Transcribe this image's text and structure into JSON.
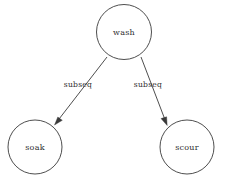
{
  "figure": {
    "caption": "",
    "background_color": "#ffffff",
    "stroke_color": "#3a3a3a",
    "text_color": "#2e2e2e"
  },
  "graph_data": {
    "type": "directed-graph",
    "layout": "tree",
    "nodes": [
      {
        "id": "wash",
        "label": "wash",
        "cx": 124,
        "cy": 32,
        "r": 27.5
      },
      {
        "id": "soak",
        "label": "soak",
        "cx": 35,
        "cy": 147,
        "r": 27.0
      },
      {
        "id": "scour",
        "label": "scour",
        "cx": 187,
        "cy": 147,
        "r": 27.0
      }
    ],
    "edges": [
      {
        "id": "wash-soak",
        "source": "wash",
        "target": "soak",
        "label": "subseq",
        "label_x": 78,
        "label_y": 85,
        "x1": 107,
        "y1": 57,
        "x2": 55,
        "y2": 124,
        "directed": true
      },
      {
        "id": "wash-scour",
        "source": "wash",
        "target": "scour",
        "label": "subseq",
        "label_x": 148,
        "label_y": 85,
        "x1": 141,
        "y1": 57,
        "x2": 168,
        "y2": 124,
        "directed": true
      }
    ]
  }
}
